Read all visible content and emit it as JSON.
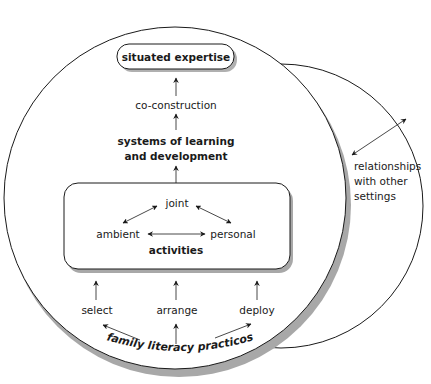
{
  "diagram": {
    "top_box": {
      "label": "situated expertise"
    },
    "co_construction": {
      "label": "co-construction"
    },
    "systems": {
      "line1": "systems of learning",
      "line2": "and development"
    },
    "activities_box": {
      "title": "activities",
      "nodes": {
        "joint": "joint",
        "ambient": "ambient",
        "personal": "personal"
      }
    },
    "practices": {
      "select": "select",
      "arrange": "arrange",
      "deploy": "deploy"
    },
    "family_literacy": {
      "label": "family literacy practicos"
    },
    "relationships": {
      "line1": "relationships",
      "line2": "with other",
      "line3": "settings"
    },
    "colors": {
      "line": "#1a1a1a",
      "shadow": "#a8a8a8",
      "background": "#ffffff"
    }
  }
}
